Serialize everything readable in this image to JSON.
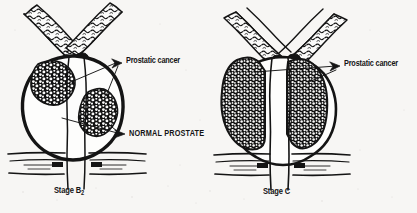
{
  "figure": {
    "background_color": "#f7f6f4",
    "ink_color": "#141414",
    "panels": [
      {
        "id": "left",
        "stage_label": "Stage B",
        "stage_subscript": "2",
        "description": "Sagittal prostate with two discrete cancer nodules and remaining normal prostate tissue",
        "labels": [
          {
            "name": "prostatic-cancer",
            "text": "Prostatic cancer"
          },
          {
            "name": "normal-prostate",
            "text": "NORMAL PROSTATE"
          }
        ]
      },
      {
        "id": "right",
        "stage_label": "Stage C",
        "stage_subscript": "",
        "description": "Sagittal prostate entirely replaced by cancer extending through the capsule",
        "labels": [
          {
            "name": "prostatic-cancer",
            "text": "Prostatic cancer"
          }
        ]
      }
    ],
    "anatomy": {
      "seminal_vesicle": "seminal-vesicle",
      "prostate_capsule": "prostate-capsule",
      "urethra": "urethra",
      "urogenital_diaphragm": "urogenital-diaphragm",
      "cancer_nodule": "cancer-nodule"
    }
  },
  "labels": {
    "left_cancer": "Prostatic cancer",
    "left_normal": "NORMAL PROSTATE",
    "left_stage": "Stage B",
    "left_stage_sub": "2",
    "right_cancer": "Prostatic cancer",
    "right_stage": "Stage C"
  }
}
